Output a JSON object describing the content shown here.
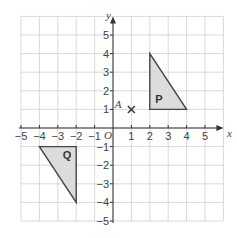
{
  "diagram": {
    "type": "coordinate-grid",
    "x_range": [
      -5,
      6
    ],
    "y_range": [
      -5,
      6
    ],
    "x_ticks": [
      -5,
      -4,
      -3,
      -2,
      -1,
      1,
      2,
      3,
      4,
      5
    ],
    "y_ticks": [
      -5,
      -4,
      -3,
      -2,
      -1,
      1,
      2,
      3,
      4,
      5
    ],
    "x_tick_labels": [
      "−5",
      "−4",
      "−3",
      "−2",
      "−1",
      "1",
      "2",
      "3",
      "4",
      "5"
    ],
    "y_tick_labels": [
      "−5",
      "−4",
      "−3",
      "−2",
      "−1",
      "1",
      "2",
      "3",
      "4",
      "5"
    ],
    "x_axis_label": "x",
    "y_axis_label": "y",
    "origin_label": "O",
    "colors": {
      "grid": "#cfcfcf",
      "axis": "#333333",
      "shape_fill": "#dcdcdc",
      "shape_stroke": "#444444"
    },
    "shapes": [
      {
        "label": "P",
        "vertices": [
          [
            2,
            1
          ],
          [
            2,
            4
          ],
          [
            4,
            1
          ]
        ]
      },
      {
        "label": "Q",
        "vertices": [
          [
            -4,
            -1
          ],
          [
            -2,
            -1
          ],
          [
            -2,
            -4
          ]
        ]
      }
    ],
    "points": [
      {
        "label": "A",
        "coords": [
          1,
          1
        ],
        "marker": "×"
      }
    ]
  }
}
